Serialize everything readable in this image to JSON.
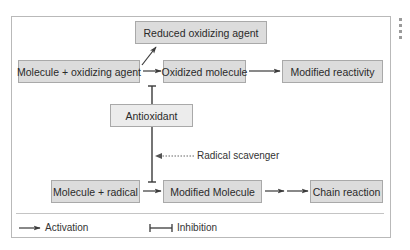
{
  "diagram": {
    "nodes": {
      "reduced_oxidizing_agent": "Reduced oxidizing agent",
      "molecule_oxidizing_agent": "Molecule + oxidizing agent",
      "oxidized_molecule": "Oxidized molecule",
      "modified_reactivity": "Modified reactivity",
      "antioxidant": "Antioxidant",
      "molecule_radical": "Molecule + radical",
      "modified_molecule": "Modified Molecule",
      "chain_reaction": "Chain reaction"
    },
    "annotations": {
      "radical_scavenger": "Radical scavenger"
    },
    "edges": [
      {
        "from": "Molecule + oxidizing agent",
        "to": "Reduced oxidizing agent",
        "type": "activation"
      },
      {
        "from": "Molecule + oxidizing agent",
        "to": "Oxidized molecule",
        "type": "activation"
      },
      {
        "from": "Oxidized molecule",
        "to": "Modified reactivity",
        "type": "activation"
      },
      {
        "from": "Antioxidant",
        "to": "Molecule + oxidizing agent → Oxidized molecule",
        "type": "inhibition"
      },
      {
        "from": "Antioxidant",
        "to": "Molecule + radical → Modified Molecule",
        "type": "inhibition"
      },
      {
        "from": "Molecule + radical",
        "to": "Modified Molecule",
        "type": "activation"
      },
      {
        "from": "Modified Molecule",
        "to": "Chain reaction",
        "type": "activation"
      }
    ],
    "legend": {
      "activation": "Activation",
      "inhibition": "Inhibition"
    },
    "colors": {
      "box_fill": "#dcdcdc",
      "box_border": "#a9a9a9",
      "line": "#333333",
      "frame": "#b9b9b9"
    }
  }
}
